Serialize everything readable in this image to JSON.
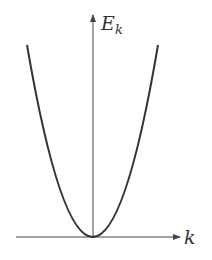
{
  "diagram": {
    "type": "dispersion-parabola",
    "y_axis_label": "E",
    "y_axis_subscript": "k",
    "x_axis_label": "k",
    "curve": "E_k ∝ k²",
    "colors": {
      "axis": "#444444",
      "curve": "#333333",
      "background": "#ffffff"
    }
  }
}
